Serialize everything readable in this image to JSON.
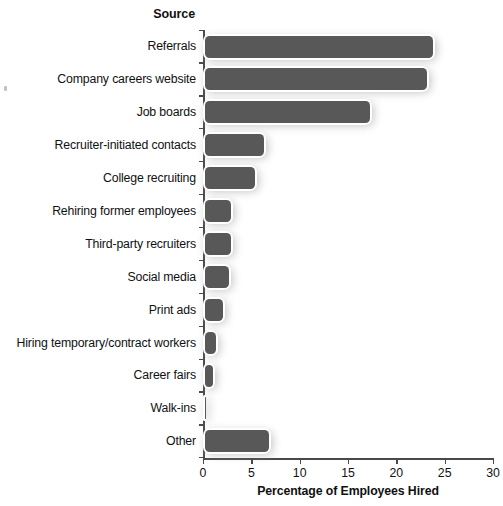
{
  "chart_data": {
    "type": "bar",
    "orientation": "horizontal",
    "title": "",
    "ylabel": "Source",
    "xlabel": "Percentage of Employees Hired",
    "xlim": [
      0,
      30
    ],
    "xticks": [
      0,
      5,
      10,
      15,
      20,
      25,
      30
    ],
    "xtick_labels": [
      "0",
      "5",
      "10",
      "15",
      "20",
      "25",
      "30"
    ],
    "grid": false,
    "legend": null,
    "categories": [
      "Referrals",
      "Company careers website",
      "Job boards",
      "Recruiter-initiated contacts",
      "College recruiting",
      "Rehiring former employees",
      "Third-party recruiters",
      "Social media",
      "Print ads",
      "Hiring temporary/contract workers",
      "Career fairs",
      "Walk-ins",
      "Other"
    ],
    "values": [
      24.0,
      23.4,
      17.5,
      6.5,
      5.6,
      3.1,
      3.1,
      2.9,
      2.3,
      1.5,
      1.2,
      0.15,
      7.0
    ],
    "bar_color": "#585858",
    "bar_edge_color": "#ffffff"
  },
  "axis": {
    "y_title": "Source",
    "x_title": "Percentage of Employees Hired"
  }
}
